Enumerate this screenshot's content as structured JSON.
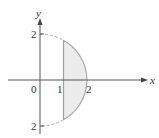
{
  "figure": {
    "axes": {
      "x_label": "x",
      "y_label": "y",
      "origin_label": "0",
      "x_ticks": [
        "1",
        "2"
      ],
      "y_top_label": "2",
      "y_bottom_label": "2"
    },
    "shapes": {
      "semicircle": "right half of circle x^2 + y^2 = 4 (radius 2)",
      "vertical_line": "x = 1",
      "shaded_region": "region between x = 1 and the circle arc, -sqrt(3) <= y <= sqrt(3)",
      "dashed_parts": "arc from (0,2) to (1,sqrt3) and from (0,-2) to (1,-sqrt3)"
    },
    "colors": {
      "axis": "#555555",
      "curve": "#b0b0b0",
      "fill": "#ececec",
      "text": "#333333"
    }
  }
}
